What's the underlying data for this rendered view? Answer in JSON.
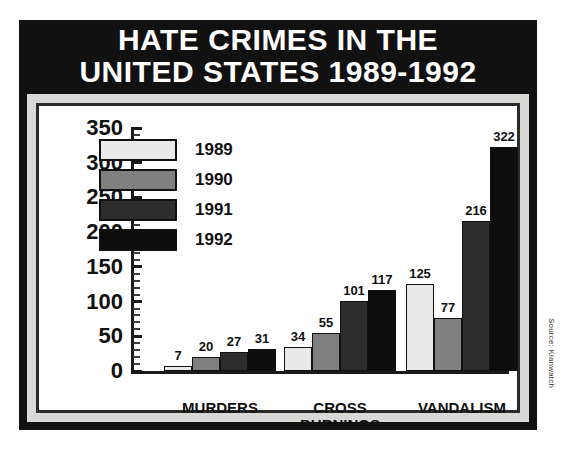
{
  "poster": {
    "title_line1": "HATE CRIMES IN THE",
    "title_line2": "UNITED STATES 1989-1992",
    "source_credit": "Source: Klanwatch",
    "background_color": "#111111",
    "title_color": "#ffffff",
    "frame_color": "#d8d8d6",
    "plot_background": "#ffffff"
  },
  "chart_data": {
    "type": "bar",
    "title": "HATE CRIMES IN THE UNITED STATES 1989-1992",
    "subtitle": "",
    "xlabel": "",
    "ylabel": "",
    "categories": [
      "MURDERS",
      "CROSS\nBURNINGS",
      "VANDALISM"
    ],
    "series": [
      {
        "name": "1989",
        "color": "#e9e9e9",
        "values": [
          7,
          34,
          125
        ]
      },
      {
        "name": "1990",
        "color": "#808080",
        "values": [
          20,
          55,
          77
        ]
      },
      {
        "name": "1991",
        "color": "#2d2d2d",
        "values": [
          27,
          101,
          216
        ]
      },
      {
        "name": "1992",
        "color": "#0d0d0d",
        "values": [
          31,
          117,
          322
        ]
      }
    ],
    "ylim": [
      0,
      350
    ],
    "ytick_values": [
      0,
      50,
      100,
      150,
      200,
      250,
      300,
      350
    ],
    "ytick_labels": [
      "0",
      "50",
      "100",
      "150",
      "200",
      "250",
      "300",
      "350"
    ],
    "minor_tick_step": 10,
    "grid": false,
    "legend_position": "upper-left-inside",
    "data_labels": true,
    "source": "Source: Klanwatch"
  }
}
